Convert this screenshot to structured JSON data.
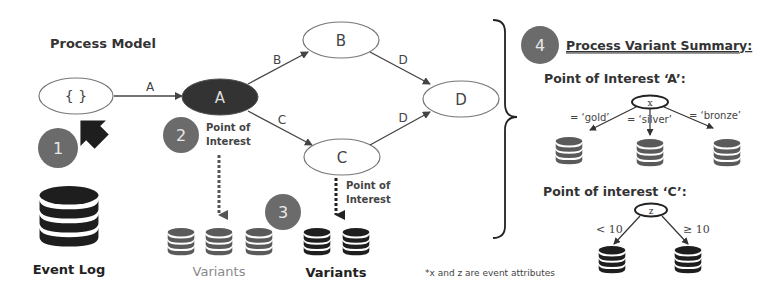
{
  "title": "Process Model",
  "colors": {
    "node_highlight": "#333333",
    "step_circle": "#6b6b6b",
    "db_dark": "#1e1e1e",
    "db_grey": "#5a5a5a",
    "edge": "#444444",
    "variants_grey_text": "#8a8a8a"
  },
  "nodes": {
    "start": "{ }",
    "a": "A",
    "b": "B",
    "c": "C",
    "d": "D"
  },
  "edges": {
    "start_a": "A",
    "a_b": "B",
    "a_c": "C",
    "b_d": "D",
    "c_d": "D"
  },
  "steps": {
    "s1": "1",
    "s2": "2",
    "s3": "3",
    "s4": "4"
  },
  "labels": {
    "poi_a_line1": "Point of",
    "poi_a_line2": "Interest",
    "poi_c_line1": "Point of",
    "poi_c_line2": "Interest",
    "event_log": "Event Log",
    "variants_a": "Variants",
    "variants_c": "Variants",
    "footnote": "*x and z are event attributes"
  },
  "summary": {
    "heading": "Process Variant Summary:",
    "poi_a": {
      "title": "Point of Interest ‘A’:",
      "attribute": "x",
      "branches": [
        "= ‘gold’",
        "= ‘silver’",
        "= ‘bronze’"
      ]
    },
    "poi_c": {
      "title": "Point of interest ‘C’:",
      "attribute": "z",
      "branches": [
        "< 10",
        "≥ 10"
      ]
    }
  }
}
